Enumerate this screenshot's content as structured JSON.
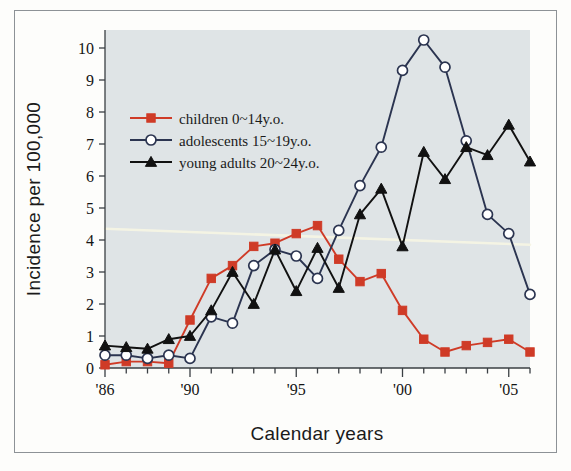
{
  "figure": {
    "background_color": "#dfe4e6",
    "page_color": "#fdfdfb",
    "border_color": "#8d9296"
  },
  "chart_data": {
    "type": "line",
    "title": "",
    "subtitle": "",
    "xlabel": "Calendar years",
    "ylabel": "Incidence per 100,000",
    "xlim": [
      1986,
      2006
    ],
    "ylim": [
      0,
      10.6
    ],
    "grid": false,
    "legend_position": "upper-left-inside",
    "x": [
      1986,
      1987,
      1988,
      1989,
      1990,
      1991,
      1992,
      1993,
      1994,
      1995,
      1996,
      1997,
      1998,
      1999,
      2000,
      2001,
      2002,
      2003,
      2004,
      2005,
      2006
    ],
    "xtick_values": [
      1986,
      1990,
      1995,
      2000,
      2005
    ],
    "xtick_labels": [
      "'86",
      "'90",
      "'95",
      "'00",
      "'05"
    ],
    "ytick_values": [
      0,
      1,
      2,
      3,
      4,
      5,
      6,
      7,
      8,
      9,
      10
    ],
    "ytick_labels": [
      "0",
      "1",
      "2",
      "3",
      "4",
      "5",
      "6",
      "7",
      "8",
      "9",
      "10"
    ],
    "series": [
      {
        "name": "children 0~14y.o.",
        "color": "#cf3b27",
        "marker": "square",
        "values": [
          0.1,
          0.2,
          0.2,
          0.15,
          1.5,
          2.8,
          3.2,
          3.8,
          3.9,
          4.2,
          4.45,
          3.4,
          2.7,
          2.95,
          1.8,
          0.9,
          0.5,
          0.7,
          0.8,
          0.9,
          0.5
        ]
      },
      {
        "name": "adolescents 15~19y.o.",
        "color": "#2b3450",
        "marker": "circle-open",
        "values": [
          0.4,
          0.4,
          0.3,
          0.4,
          0.3,
          1.6,
          1.4,
          3.2,
          3.7,
          3.5,
          2.8,
          4.3,
          5.7,
          6.9,
          9.3,
          10.25,
          9.4,
          7.1,
          4.8,
          4.2,
          2.3
        ]
      },
      {
        "name": "young adults 20~24y.o.",
        "color": "#111111",
        "marker": "triangle",
        "values": [
          0.7,
          0.65,
          0.6,
          0.9,
          1.0,
          1.8,
          3.0,
          2.0,
          3.7,
          2.4,
          3.75,
          2.5,
          4.8,
          5.6,
          3.8,
          6.75,
          5.9,
          6.9,
          6.65,
          7.6,
          6.45
        ]
      }
    ],
    "annotation_line": {
      "name": "scan-artifact-streak",
      "color": "#f6f5e4",
      "start_value": 4.35,
      "end_value": 3.85
    }
  }
}
